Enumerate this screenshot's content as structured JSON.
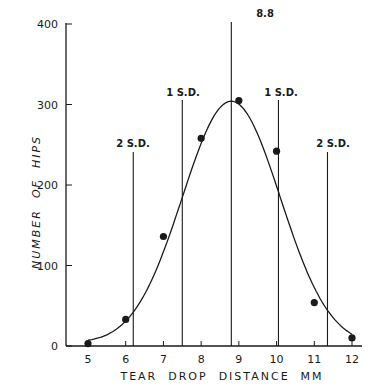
{
  "chart_data": {
    "type": "scatter",
    "title": "",
    "xlabel": "TEAR  DROP  DISTANCE  MM",
    "ylabel": "NUMBER  OF  HIPS",
    "xlim": [
      5,
      12
    ],
    "ylim": [
      0,
      400
    ],
    "x_ticks": [
      5,
      6,
      7,
      8,
      9,
      10,
      11,
      12
    ],
    "y_ticks": [
      0,
      100,
      200,
      300,
      400
    ],
    "grid": false,
    "legend": null,
    "series": [
      {
        "name": "Observed hips",
        "type": "scatter",
        "x": [
          5,
          6,
          7,
          8,
          9,
          10,
          11,
          12
        ],
        "values": [
          3,
          33,
          136,
          258,
          305,
          242,
          54,
          10
        ]
      },
      {
        "name": "Fitted normal curve",
        "type": "line",
        "mean": 8.8,
        "sd": 1.3,
        "peak": 304
      }
    ],
    "annotations": [
      {
        "label": "2 S.D.",
        "x": 6.2,
        "type": "vline"
      },
      {
        "label": "1 S.D.",
        "x": 7.5,
        "type": "vline"
      },
      {
        "label": "8.8",
        "x": 8.8,
        "type": "vline"
      },
      {
        "label": "1 S.D.",
        "x": 10.05,
        "type": "vline"
      },
      {
        "label": "2 S.D.",
        "x": 11.35,
        "type": "vline"
      }
    ]
  },
  "labels": {
    "xlabel": "TEAR  DROP  DISTANCE  MM",
    "ylabel": "NUMBER  OF  HIPS",
    "mean_label": "8.8",
    "sd1_left": "1 S.D.",
    "sd1_right": "1 S.D.",
    "sd2_left": "2 S.D.",
    "sd2_right": "2 S.D."
  },
  "colors": {
    "ink": "#1a1a1a",
    "background": "#ffffff"
  }
}
